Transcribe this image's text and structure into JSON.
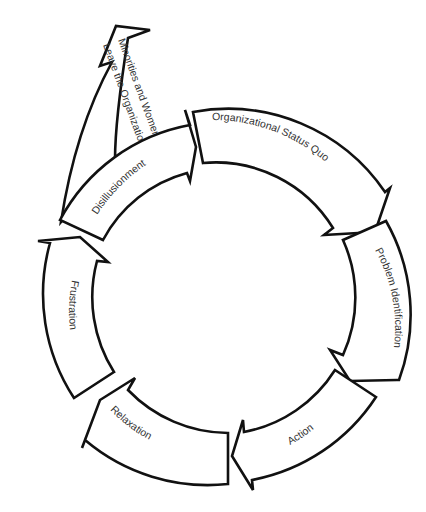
{
  "diagram": {
    "type": "cycle",
    "colors": {
      "stroke": "#111111",
      "fill": "#ffffff",
      "text": "#333333",
      "background": "#ffffff"
    },
    "cycle_stages": [
      {
        "id": "status-quo",
        "label": "Organizational Status Quo"
      },
      {
        "id": "problem-identification",
        "label": "Problem Identification"
      },
      {
        "id": "action",
        "label": "Action"
      },
      {
        "id": "relaxation",
        "label": "Relaxation"
      },
      {
        "id": "frustration",
        "label": "Frustration"
      },
      {
        "id": "disillusionment",
        "label": "Disillusionment"
      }
    ],
    "exit_arrow": {
      "from": "disillusionment",
      "label_line1": "Minorities and Women",
      "label_line2": "Leave the Organization"
    }
  }
}
